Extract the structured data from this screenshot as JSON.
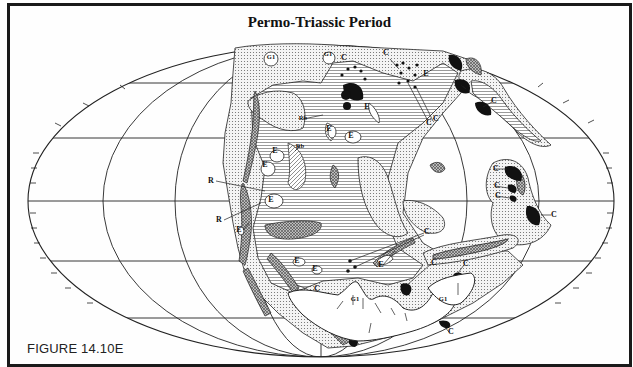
{
  "figure": {
    "title": "Permo-Triassic Period",
    "label": "FIGURE 14.10E"
  },
  "colors": {
    "frame": "#1a1a1a",
    "line": "#222222",
    "solid_deposit": "#111111",
    "background": "#fefefe"
  },
  "map": {
    "projection": "elliptical (Mollweide-like) world map",
    "latitude_lines": 5,
    "meridian_lines": 7,
    "legend_symbols": {
      "C": "C",
      "E": "E",
      "R": "R",
      "Rb": "Rb",
      "G1": "G1"
    },
    "labels": [
      {
        "text": "G1",
        "x": 268,
        "y": 56
      },
      {
        "text": "G1",
        "x": 325,
        "y": 53
      },
      {
        "text": "C",
        "x": 341,
        "y": 57
      },
      {
        "text": "C",
        "x": 383,
        "y": 52
      },
      {
        "text": "E",
        "x": 423,
        "y": 73
      },
      {
        "text": "C",
        "x": 460,
        "y": 88
      },
      {
        "text": "C",
        "x": 426,
        "y": 122
      },
      {
        "text": "C",
        "x": 433,
        "y": 118
      },
      {
        "text": "C",
        "x": 491,
        "y": 100
      },
      {
        "text": "Rb",
        "x": 300,
        "y": 117
      },
      {
        "text": "E",
        "x": 326,
        "y": 128
      },
      {
        "text": "Rb",
        "x": 297,
        "y": 145
      },
      {
        "text": "E",
        "x": 348,
        "y": 135
      },
      {
        "text": "E",
        "x": 364,
        "y": 106
      },
      {
        "text": "E",
        "x": 272,
        "y": 150
      },
      {
        "text": "E",
        "x": 262,
        "y": 164
      },
      {
        "text": "R",
        "x": 208,
        "y": 180
      },
      {
        "text": "E",
        "x": 268,
        "y": 199
      },
      {
        "text": "R",
        "x": 216,
        "y": 219
      },
      {
        "text": "E",
        "x": 236,
        "y": 229
      },
      {
        "text": "C",
        "x": 493,
        "y": 168
      },
      {
        "text": "C",
        "x": 494,
        "y": 185
      },
      {
        "text": "C",
        "x": 495,
        "y": 195
      },
      {
        "text": "C",
        "x": 551,
        "y": 214
      },
      {
        "text": "C",
        "x": 424,
        "y": 231
      },
      {
        "text": "E",
        "x": 378,
        "y": 264
      },
      {
        "text": "C",
        "x": 431,
        "y": 262
      },
      {
        "text": "C",
        "x": 463,
        "y": 263
      },
      {
        "text": "E",
        "x": 294,
        "y": 260
      },
      {
        "text": "E",
        "x": 312,
        "y": 268
      },
      {
        "text": "C",
        "x": 314,
        "y": 288
      },
      {
        "text": "G1",
        "x": 352,
        "y": 298
      },
      {
        "text": "G1",
        "x": 440,
        "y": 298
      },
      {
        "text": "C",
        "x": 448,
        "y": 331
      }
    ]
  }
}
